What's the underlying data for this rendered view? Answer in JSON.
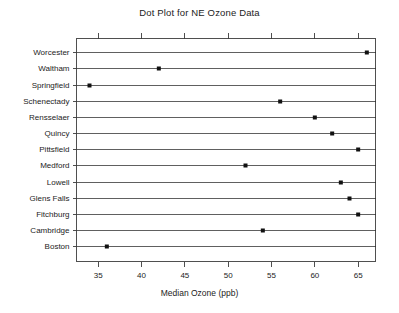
{
  "chart_data": {
    "type": "scatter",
    "variant": "dot-plot",
    "title": "Dot Plot for NE Ozone Data",
    "xlabel": "Median Ozone (ppb)",
    "ylabel": "",
    "categories": [
      "Worcester",
      "Waltham",
      "Springfield",
      "Schenectady",
      "Rensselaer",
      "Quincy",
      "Pittsfield",
      "Medford",
      "Lowell",
      "Glens Falls",
      "Fitchburg",
      "Cambridge",
      "Boston"
    ],
    "values": [
      66,
      42,
      34,
      56,
      60,
      62,
      65,
      52,
      63,
      64,
      65,
      54,
      36
    ],
    "xticks": [
      35,
      40,
      45,
      50,
      55,
      60,
      65
    ],
    "xlim": [
      32.5,
      67.0
    ],
    "grid": false,
    "legend": false,
    "legend_position": "none",
    "series": [
      {
        "name": "Median Ozone (ppb)",
        "values": [
          66,
          42,
          34,
          56,
          60,
          62,
          65,
          52,
          63,
          64,
          65,
          54,
          36
        ]
      }
    ],
    "annotations": []
  },
  "style": {
    "background": "#ffffff",
    "axis_color": "#3c3c3c",
    "row_line_color": "#2b2b2b",
    "dot_color": "#111111",
    "text_color": "#1c1c1c"
  }
}
